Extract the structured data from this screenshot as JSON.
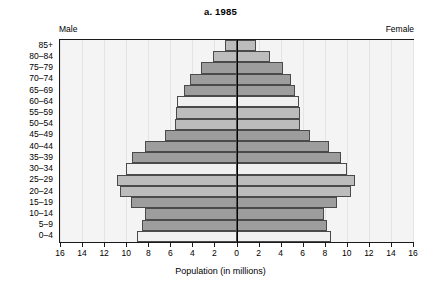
{
  "chart_data": {
    "type": "bar",
    "subtype": "population-pyramid",
    "title": "a. 1985",
    "xlabel": "Population (in millions)",
    "ylabel": "",
    "grid": true,
    "legend_position": "none",
    "left_side_label": "Male",
    "right_side_label": "Female",
    "categories": [
      "0–4",
      "5–9",
      "10–14",
      "15–19",
      "20–24",
      "25–29",
      "30–34",
      "35–39",
      "40–44",
      "45–49",
      "50–54",
      "55–59",
      "60–64",
      "65–69",
      "70–74",
      "75–79",
      "80–84",
      "85+"
    ],
    "xlim": [
      -16,
      16
    ],
    "xticks": [
      16,
      14,
      12,
      10,
      8,
      6,
      4,
      2,
      0,
      2,
      4,
      6,
      8,
      10,
      12,
      14,
      16
    ],
    "xtick_labels": [
      "16",
      "14",
      "12",
      "10",
      "8",
      "6",
      "4",
      "2",
      "0",
      "2",
      "4",
      "6",
      "8",
      "10",
      "12",
      "14",
      "16"
    ],
    "series": [
      {
        "name": "Male",
        "side": "left",
        "values": [
          9.0,
          8.6,
          8.3,
          9.6,
          10.6,
          10.8,
          10.0,
          9.5,
          8.3,
          6.5,
          5.6,
          5.5,
          5.4,
          4.8,
          4.2,
          3.2,
          2.1,
          1.0
        ]
      },
      {
        "name": "Female",
        "side": "right",
        "values": [
          8.6,
          8.2,
          7.9,
          9.1,
          10.4,
          10.7,
          10.0,
          9.5,
          8.4,
          6.7,
          5.8,
          5.8,
          5.7,
          5.3,
          4.9,
          4.2,
          3.0,
          1.8
        ]
      }
    ],
    "band_shades": [
      "light",
      "dark",
      "dark",
      "dark",
      "medium",
      "medium",
      "light",
      "dark",
      "dark",
      "dark",
      "medium",
      "medium",
      "light",
      "dark",
      "dark",
      "dark",
      "medium",
      "medium"
    ],
    "colors": {
      "dark": "#9d9d9d",
      "medium": "#bcbcbc",
      "light": "#f0f0f0",
      "bar_border": "#4a4a4a",
      "plot_background": "#f4f4f4",
      "gridline": "#e4e4e4",
      "axis": "#1a1a1a",
      "center_line": "#000000"
    }
  }
}
